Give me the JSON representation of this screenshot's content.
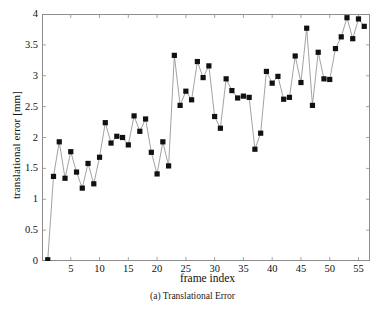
{
  "figure": {
    "caption": "(a) Translational Error",
    "xlabel": "frame index",
    "ylabel": "translational error [mm]"
  },
  "axes": {
    "y_ticks": [
      "0",
      "0.5",
      "1",
      "1.5",
      "2",
      "2.5",
      "3",
      "3.5",
      "4"
    ],
    "x_ticks": [
      "5",
      "10",
      "15",
      "20",
      "25",
      "30",
      "35",
      "40",
      "45",
      "50",
      "55"
    ]
  },
  "style": {
    "marker_color": "#111111",
    "line_color": "#8a8a8a",
    "frame_color": "#8d8d8d",
    "background": "#ffffff"
  },
  "chart_data": {
    "type": "line",
    "title": "(a) Translational Error",
    "xlabel": "frame index",
    "ylabel": "translational error [mm]",
    "xlim": [
      0,
      57
    ],
    "ylim": [
      0,
      4
    ],
    "ytick_values": [
      0,
      0.5,
      1,
      1.5,
      2,
      2.5,
      3,
      3.5,
      4
    ],
    "xtick_values": [
      5,
      10,
      15,
      20,
      25,
      30,
      35,
      40,
      45,
      50,
      55
    ],
    "grid": false,
    "legend": null,
    "marker": "square",
    "series": [
      {
        "name": "translational error",
        "x": [
          1,
          2,
          3,
          4,
          5,
          6,
          7,
          8,
          9,
          10,
          11,
          12,
          13,
          14,
          15,
          16,
          17,
          18,
          19,
          20,
          21,
          22,
          23,
          24,
          25,
          26,
          27,
          28,
          29,
          30,
          31,
          32,
          33,
          34,
          35,
          36,
          37,
          38,
          39,
          40,
          41,
          42,
          43,
          44,
          45,
          46,
          47,
          48,
          49,
          50,
          51,
          52,
          53,
          54,
          55,
          56
        ],
        "y": [
          0.02,
          1.37,
          1.93,
          1.34,
          1.77,
          1.44,
          1.18,
          1.58,
          1.25,
          1.68,
          2.24,
          1.91,
          2.02,
          2.0,
          1.88,
          2.35,
          2.1,
          2.3,
          1.76,
          1.41,
          1.93,
          1.54,
          3.33,
          2.52,
          2.75,
          2.61,
          3.23,
          2.97,
          3.16,
          2.34,
          2.15,
          2.95,
          2.76,
          2.64,
          2.67,
          2.65,
          1.81,
          2.07,
          3.07,
          2.88,
          2.99,
          2.62,
          2.65,
          3.32,
          2.89,
          3.77,
          2.52,
          3.38,
          2.95,
          2.94,
          3.44,
          3.63,
          3.94,
          3.6,
          3.92,
          3.8
        ]
      }
    ]
  }
}
